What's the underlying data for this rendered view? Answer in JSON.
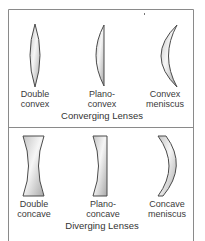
{
  "diagram": {
    "sections": [
      {
        "caption": "Converging Lenses",
        "lenses": [
          {
            "type": "double-convex",
            "label_line1": "Double",
            "label_line2": "convex"
          },
          {
            "type": "plano-convex",
            "label_line1": "Plano-",
            "label_line2": "convex"
          },
          {
            "type": "convex-meniscus",
            "label_line1": "Convex",
            "label_line2": "meniscus"
          }
        ]
      },
      {
        "caption": "Diverging Lenses",
        "lenses": [
          {
            "type": "double-concave",
            "label_line1": "Double",
            "label_line2": "concave"
          },
          {
            "type": "plano-concave",
            "label_line1": "Plano-",
            "label_line2": "concave"
          },
          {
            "type": "concave-meniscus",
            "label_line1": "Concave",
            "label_line2": "meniscus"
          }
        ]
      }
    ],
    "colors": {
      "border": "#8a8a8a",
      "lens_outline": "#4a4a4a",
      "lens_fill_light": "#f4f4f4",
      "lens_fill_dark": "#b8b8b8"
    }
  }
}
